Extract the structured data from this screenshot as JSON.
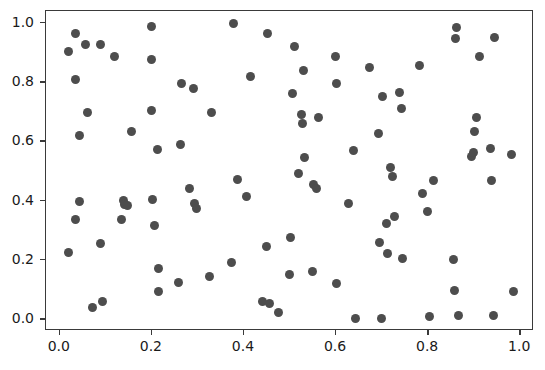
{
  "chart_data": {
    "type": "scatter",
    "title": "",
    "subtitle": "",
    "xlabel": "",
    "ylabel": "",
    "xlim": [
      -0.03,
      1.03
    ],
    "ylim": [
      -0.04,
      1.04
    ],
    "xticks": [
      0.0,
      0.2,
      0.4,
      0.6,
      0.8,
      1.0
    ],
    "yticks": [
      0.0,
      0.2,
      0.4,
      0.6,
      0.8,
      1.0
    ],
    "xticklabels": [
      "0.0",
      "0.2",
      "0.4",
      "0.6",
      "0.8",
      "1.0"
    ],
    "yticklabels": [
      "0.0",
      "0.2",
      "0.4",
      "0.6",
      "0.8",
      "1.0"
    ],
    "grid": false,
    "legend": null,
    "legend_position": "none",
    "marker": "circle",
    "marker_color": "#4d4d4d",
    "marker_size_px": 9,
    "frame_color": "#3a3a3a",
    "background_color": "#ffffff",
    "n_points": 110,
    "series": [
      {
        "name": "points",
        "points": [
          [
            0.018,
            0.905
          ],
          [
            0.018,
            0.225
          ],
          [
            0.035,
            0.965
          ],
          [
            0.035,
            0.81
          ],
          [
            0.035,
            0.335
          ],
          [
            0.042,
            0.62
          ],
          [
            0.042,
            0.398
          ],
          [
            0.055,
            0.928
          ],
          [
            0.06,
            0.698
          ],
          [
            0.07,
            0.04
          ],
          [
            0.088,
            0.928
          ],
          [
            0.088,
            0.255
          ],
          [
            0.092,
            0.058
          ],
          [
            0.118,
            0.885
          ],
          [
            0.135,
            0.335
          ],
          [
            0.138,
            0.402
          ],
          [
            0.14,
            0.388
          ],
          [
            0.148,
            0.385
          ],
          [
            0.155,
            0.635
          ],
          [
            0.2,
            0.988
          ],
          [
            0.2,
            0.878
          ],
          [
            0.2,
            0.705
          ],
          [
            0.202,
            0.403
          ],
          [
            0.205,
            0.315
          ],
          [
            0.212,
            0.572
          ],
          [
            0.215,
            0.172
          ],
          [
            0.215,
            0.093
          ],
          [
            0.258,
            0.125
          ],
          [
            0.262,
            0.588
          ],
          [
            0.265,
            0.795
          ],
          [
            0.282,
            0.44
          ],
          [
            0.29,
            0.778
          ],
          [
            0.292,
            0.392
          ],
          [
            0.296,
            0.375
          ],
          [
            0.325,
            0.145
          ],
          [
            0.33,
            0.698
          ],
          [
            0.372,
            0.19
          ],
          [
            0.378,
            0.998
          ],
          [
            0.385,
            0.47
          ],
          [
            0.405,
            0.415
          ],
          [
            0.415,
            0.82
          ],
          [
            0.44,
            0.058
          ],
          [
            0.448,
            0.245
          ],
          [
            0.452,
            0.965
          ],
          [
            0.455,
            0.052
          ],
          [
            0.475,
            0.022
          ],
          [
            0.498,
            0.152
          ],
          [
            0.5,
            0.275
          ],
          [
            0.505,
            0.762
          ],
          [
            0.51,
            0.92
          ],
          [
            0.518,
            0.49
          ],
          [
            0.525,
            0.692
          ],
          [
            0.528,
            0.662
          ],
          [
            0.53,
            0.838
          ],
          [
            0.532,
            0.545
          ],
          [
            0.548,
            0.162
          ],
          [
            0.552,
            0.455
          ],
          [
            0.558,
            0.44
          ],
          [
            0.562,
            0.682
          ],
          [
            0.598,
            0.885
          ],
          [
            0.6,
            0.795
          ],
          [
            0.602,
            0.122
          ],
          [
            0.628,
            0.392
          ],
          [
            0.638,
            0.568
          ],
          [
            0.642,
            0.002
          ],
          [
            0.672,
            0.848
          ],
          [
            0.692,
            0.628
          ],
          [
            0.695,
            0.258
          ],
          [
            0.698,
            0.002
          ],
          [
            0.702,
            0.752
          ],
          [
            0.71,
            0.322
          ],
          [
            0.712,
            0.222
          ],
          [
            0.718,
            0.512
          ],
          [
            0.722,
            0.482
          ],
          [
            0.728,
            0.345
          ],
          [
            0.738,
            0.765
          ],
          [
            0.742,
            0.712
          ],
          [
            0.745,
            0.205
          ],
          [
            0.782,
            0.855
          ],
          [
            0.788,
            0.425
          ],
          [
            0.798,
            0.362
          ],
          [
            0.802,
            0.008
          ],
          [
            0.812,
            0.468
          ],
          [
            0.855,
            0.2
          ],
          [
            0.858,
            0.098
          ],
          [
            0.86,
            0.948
          ],
          [
            0.862,
            0.985
          ],
          [
            0.865,
            0.012
          ],
          [
            0.895,
            0.548
          ],
          [
            0.898,
            0.562
          ],
          [
            0.9,
            0.635
          ],
          [
            0.905,
            0.682
          ],
          [
            0.912,
            0.888
          ],
          [
            0.935,
            0.575
          ],
          [
            0.938,
            0.468
          ],
          [
            0.942,
            0.012
          ],
          [
            0.945,
            0.95
          ],
          [
            0.982,
            0.555
          ],
          [
            0.985,
            0.092
          ]
        ]
      }
    ]
  },
  "axes": {
    "x_tick_labels": [
      "0.0",
      "0.2",
      "0.4",
      "0.6",
      "0.8",
      "1.0"
    ],
    "y_tick_labels": [
      "0.0",
      "0.2",
      "0.4",
      "0.6",
      "0.8",
      "1.0"
    ]
  }
}
